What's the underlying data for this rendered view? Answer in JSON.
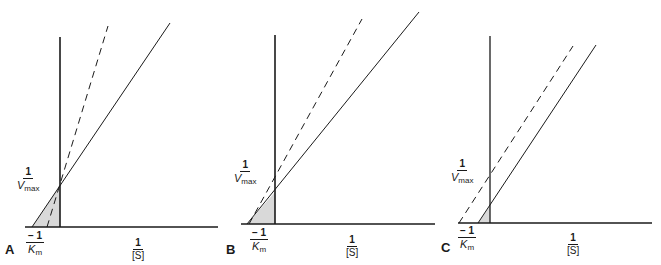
{
  "colors": {
    "ink": "#1a1a1a",
    "shade": "#d9d9d9"
  },
  "labels": {
    "one": "1",
    "neg_one": "− 1",
    "v_symbol": "V",
    "v_sub": "max",
    "k_symbol": "K",
    "k_sub": "m",
    "s_denominator": "[S]"
  },
  "panels": [
    {
      "letter": "A",
      "description": "Lineweaver-Burk plot: lines intersect on the y-axis (same 1/Vmax, different Km)"
    },
    {
      "letter": "B",
      "description": "Lineweaver-Burk plot: lines intersect near the x-axis (same Km, different Vmax)"
    },
    {
      "letter": "C",
      "description": "Lineweaver-Burk plot: parallel lines (both Km and Vmax change)"
    }
  ]
}
